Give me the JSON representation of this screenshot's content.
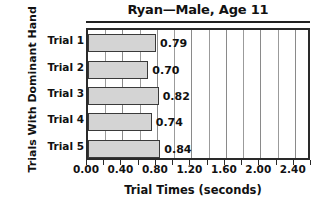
{
  "chart_data": {
    "type": "bar",
    "orientation": "horizontal",
    "title": "Ryan—Male, Age 11",
    "xlabel": "Trial Times (seconds)",
    "ylabel": "Trials With Dominant Hand",
    "categories": [
      "Trial 1",
      "Trial 2",
      "Trial 3",
      "Trial 4",
      "Trial 5"
    ],
    "values": [
      0.79,
      0.7,
      0.82,
      0.74,
      0.84
    ],
    "value_labels": [
      "0.79",
      "0.70",
      "0.82",
      "0.74",
      "0.84"
    ],
    "xlim": [
      0.0,
      2.6
    ],
    "xtick_labels": [
      "0.00",
      "0.40",
      "0.80",
      "1.20",
      "1.60",
      "2.00",
      "2.40"
    ],
    "xtick_values": [
      0.0,
      0.4,
      0.8,
      1.2,
      1.6,
      2.0,
      2.4
    ],
    "xtick_minor_values": [
      0.2,
      0.6,
      1.0,
      1.4,
      1.8,
      2.2,
      2.6
    ],
    "grid": "vertical",
    "legend": "none",
    "bar_fill_color": "#d4d4d4",
    "bar_edge_color": "#3a3a3a",
    "axis_color": "#2a2a2a",
    "grid_color": "#9b9b9b",
    "background_color": "#ffffff"
  }
}
